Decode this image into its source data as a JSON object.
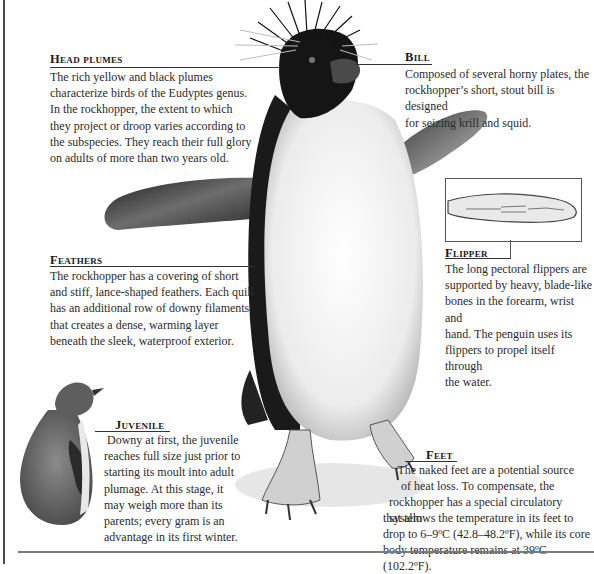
{
  "sections": {
    "head_plumes": {
      "title": "Head plumes",
      "lines": [
        "The rich yellow and black plumes",
        "characterize birds of the Eudyptes genus.",
        "In the rockhopper, the extent to which",
        "they project or droop varies according to",
        "the subspecies. They reach their full glory",
        "on adults of more than two years old."
      ]
    },
    "bill": {
      "title": "Bill",
      "lines": [
        "Composed of several horny plates, the",
        "rockhopper’s short, stout bill is designed",
        "for seizing krill and squid."
      ]
    },
    "feathers": {
      "title": "Feathers",
      "lines": [
        "The rockhopper has a covering of short",
        "and stiff, lance-shaped feathers. Each quill",
        "has an additional row of downy filaments",
        "that creates a dense, warming layer",
        "beneath the sleek, waterproof exterior."
      ]
    },
    "flipper": {
      "title": "Flipper",
      "lines": [
        "The long pectoral flippers are",
        "supported by heavy, blade-like",
        "bones in the forearm, wrist and",
        "hand. The penguin uses its",
        "flippers to propel itself through",
        "the water."
      ]
    },
    "juvenile": {
      "title": "Juvenile",
      "lines": [
        " Downy at first, the juvenile",
        "reaches full size just prior to",
        "starting its moult into adult",
        "plumage. At this stage, it",
        "may weigh more than its",
        "parents; every gram is an",
        "advantage in its first winter."
      ]
    },
    "feet": {
      "title": "Feet",
      "lines": [
        "The naked feet are a potential source",
        "of heat loss. To compensate, the",
        "rockhopper has a special circulatory system",
        "that allows the temperature in its feet to",
        "drop to 6–9ºC (42.8–48.2ºF), while its core",
        "body temperature remains at 39ºC (102.2ºF)."
      ]
    }
  },
  "colors": {
    "text": "#2b2b2b",
    "rule": "#333333",
    "frame": "#4a4a4a"
  }
}
